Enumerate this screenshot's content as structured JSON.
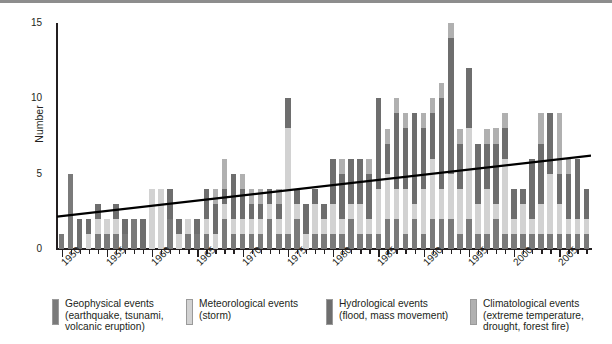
{
  "chart_data": {
    "type": "bar",
    "stacked": true,
    "title": "",
    "subtitle": "",
    "xlabel": "",
    "ylabel": "Number",
    "ylim": [
      0,
      15
    ],
    "yticks": [
      0,
      5,
      10,
      15
    ],
    "yticks_minor_step": 1,
    "grid": false,
    "legend_position": "bottom",
    "x": [
      1950,
      1951,
      1952,
      1953,
      1954,
      1955,
      1956,
      1957,
      1958,
      1959,
      1960,
      1961,
      1962,
      1963,
      1964,
      1965,
      1966,
      1967,
      1968,
      1969,
      1970,
      1971,
      1972,
      1973,
      1974,
      1975,
      1976,
      1977,
      1978,
      1979,
      1980,
      1981,
      1982,
      1983,
      1984,
      1985,
      1986,
      1987,
      1988,
      1989,
      1990,
      1991,
      1992,
      1993,
      1994,
      1995,
      1996,
      1997,
      1998,
      1999,
      2000,
      2001,
      2002,
      2003,
      2004,
      2005,
      2006,
      2007,
      2008
    ],
    "xtick_labels": [
      "1950",
      "1955",
      "1960",
      "1965",
      "1970",
      "1975",
      "1980",
      "1985",
      "1990",
      "1995",
      "2000",
      "2005"
    ],
    "xtick_values": [
      1950,
      1955,
      1960,
      1965,
      1970,
      1975,
      1980,
      1985,
      1990,
      1995,
      2000,
      2005
    ],
    "series": [
      {
        "name": "Geophysical events",
        "key": "geo",
        "color": "#7a7a7a",
        "values": [
          1,
          5,
          0,
          0,
          1,
          1,
          1,
          1,
          2,
          0,
          0,
          0,
          2,
          0,
          1,
          1,
          1,
          0,
          2,
          1,
          1,
          1,
          1,
          2,
          1,
          1,
          2,
          0,
          1,
          1,
          1,
          1,
          2,
          1,
          1,
          1,
          2,
          2,
          1,
          2,
          1,
          2,
          2,
          2,
          1,
          2,
          1,
          1,
          2,
          1,
          1,
          1,
          1,
          1,
          1,
          1,
          1,
          1,
          1
        ]
      },
      {
        "name": "Meteorological events",
        "key": "met",
        "color": "#d2d2d2",
        "values": [
          0,
          0,
          0,
          1,
          1,
          1,
          1,
          0,
          0,
          0,
          4,
          4,
          0,
          1,
          1,
          0,
          1,
          1,
          1,
          1,
          1,
          1,
          1,
          1,
          1,
          7,
          1,
          1,
          2,
          1,
          2,
          1,
          1,
          2,
          1,
          3,
          3,
          2,
          3,
          1,
          3,
          4,
          2,
          3,
          3,
          6,
          2,
          3,
          1,
          5,
          1,
          2,
          1,
          2,
          4,
          2,
          1,
          1,
          1
        ]
      },
      {
        "name": "Hydrological events",
        "key": "hyd",
        "color": "#6e6e6e",
        "values": [
          0,
          0,
          2,
          1,
          1,
          0,
          1,
          1,
          0,
          2,
          0,
          0,
          2,
          1,
          0,
          1,
          2,
          2,
          1,
          3,
          2,
          1,
          1,
          1,
          1,
          2,
          1,
          2,
          1,
          1,
          3,
          3,
          3,
          3,
          3,
          6,
          2,
          5,
          4,
          6,
          4,
          3,
          6,
          9,
          3,
          4,
          4,
          3,
          4,
          2,
          2,
          1,
          4,
          4,
          4,
          2,
          3,
          4,
          2
        ]
      },
      {
        "name": "Climatological events",
        "key": "cli",
        "color": "#b0b0b0",
        "values": [
          0,
          0,
          0,
          0,
          0,
          0,
          0,
          0,
          0,
          0,
          0,
          0,
          0,
          0,
          0,
          0,
          0,
          1,
          2,
          0,
          1,
          1,
          1,
          0,
          1,
          0,
          0,
          0,
          0,
          0,
          0,
          1,
          0,
          0,
          1,
          0,
          1,
          1,
          1,
          0,
          1,
          1,
          1,
          1,
          1,
          0,
          0,
          1,
          1,
          1,
          0,
          0,
          0,
          2,
          0,
          4,
          1,
          0,
          0
        ]
      }
    ],
    "totals": [
      1,
      5,
      2,
      2,
      3,
      2,
      3,
      2,
      2,
      2,
      4,
      4,
      4,
      2,
      2,
      2,
      4,
      4,
      6,
      5,
      5,
      4,
      4,
      4,
      4,
      10,
      4,
      3,
      4,
      3,
      6,
      6,
      6,
      6,
      6,
      10,
      8,
      10,
      9,
      9,
      9,
      10,
      11,
      15,
      8,
      12,
      7,
      8,
      8,
      9,
      4,
      4,
      6,
      9,
      9,
      9,
      6,
      6,
      4
    ],
    "trend": {
      "type": "line",
      "color": "#000000",
      "start": {
        "x": 1950,
        "y": 2.15
      },
      "end": {
        "x": 2008,
        "y": 6.2
      }
    }
  },
  "axis": {
    "y_title": "Number",
    "y_tick_labels": [
      "0",
      "5",
      "10",
      "15"
    ]
  },
  "legend": {
    "items": [
      {
        "key": "geo",
        "color": "#7a7a7a",
        "label": "Geophysical events\n(earthquake, tsunami,\nvolcanic eruption)"
      },
      {
        "key": "met",
        "color": "#d2d2d2",
        "label": "Meteorological events\n(storm)"
      },
      {
        "key": "hyd",
        "color": "#6e6e6e",
        "label": "Hydrological events\n(flood, mass movement)"
      },
      {
        "key": "cli",
        "color": "#b0b0b0",
        "label": "Climatological events\n(extreme temperature,\ndrought, forest fire)"
      }
    ]
  }
}
